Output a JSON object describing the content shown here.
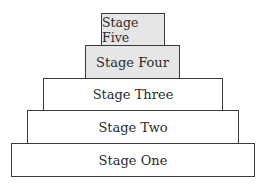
{
  "diagram": {
    "type": "stepped-pyramid",
    "stages": [
      {
        "label": "Stage One",
        "shaded": false
      },
      {
        "label": "Stage Two",
        "shaded": false
      },
      {
        "label": "Stage Three",
        "shaded": false
      },
      {
        "label": "Stage Four",
        "shaded": true
      },
      {
        "label": "Stage Five",
        "shaded": true
      }
    ],
    "colors": {
      "shaded_fill": "#e6e6e6",
      "plain_fill": "#ffffff",
      "border": "#3a3a3a"
    }
  }
}
